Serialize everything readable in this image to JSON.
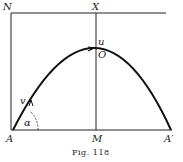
{
  "figure": {
    "caption": "Fig. 118",
    "labels": {
      "N": "N",
      "X": "X",
      "u": "u",
      "O": "O",
      "v": "v",
      "alpha": "α",
      "A": "A",
      "M": "M",
      "A_prime": "A′"
    }
  }
}
